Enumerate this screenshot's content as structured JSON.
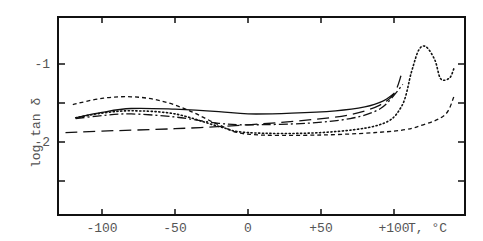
{
  "chart_data": {
    "type": "line",
    "title": "",
    "xlabel": "T, °C",
    "ylabel": "log tan δ",
    "xlim": [
      -125,
      155
    ],
    "ylim": [
      -3.0,
      -0.4
    ],
    "xticks": [
      -100,
      -50,
      0,
      50,
      100
    ],
    "xtick_labels": [
      "-100",
      "-50",
      "0",
      "+50",
      "+100"
    ],
    "yticks": [
      -1,
      -1.5,
      -2,
      -2.5
    ],
    "ytick_labels": [
      "-1",
      "",
      "-2",
      ""
    ],
    "grid": false,
    "legend": null,
    "series": [
      {
        "name": "solid",
        "style": "solid",
        "points": [
          [
            -118,
            -1.69
          ],
          [
            -100,
            -1.62
          ],
          [
            -80,
            -1.57
          ],
          [
            -50,
            -1.58
          ],
          [
            -20,
            -1.61
          ],
          [
            0,
            -1.64
          ],
          [
            30,
            -1.63
          ],
          [
            60,
            -1.6
          ],
          [
            80,
            -1.55
          ],
          [
            92,
            -1.48
          ],
          [
            100,
            -1.38
          ]
        ]
      },
      {
        "name": "long-dash",
        "style": "long-dash",
        "points": [
          [
            -125,
            -1.88
          ],
          [
            -100,
            -1.86
          ],
          [
            -50,
            -1.83
          ],
          [
            0,
            -1.78
          ],
          [
            40,
            -1.72
          ],
          [
            70,
            -1.65
          ],
          [
            90,
            -1.53
          ],
          [
            100,
            -1.38
          ],
          [
            105,
            -1.14
          ]
        ]
      },
      {
        "name": "dash-dot",
        "style": "dash-dot",
        "points": [
          [
            -118,
            -1.7
          ],
          [
            -100,
            -1.66
          ],
          [
            -80,
            -1.64
          ],
          [
            -50,
            -1.68
          ],
          [
            -20,
            -1.76
          ],
          [
            0,
            -1.78
          ],
          [
            40,
            -1.76
          ],
          [
            70,
            -1.7
          ],
          [
            90,
            -1.58
          ],
          [
            100,
            -1.4
          ],
          [
            106,
            -1.26
          ]
        ]
      },
      {
        "name": "dotted",
        "style": "dotted",
        "points": [
          [
            -118,
            -1.69
          ],
          [
            -100,
            -1.63
          ],
          [
            -80,
            -1.6
          ],
          [
            -50,
            -1.64
          ],
          [
            -20,
            -1.8
          ],
          [
            0,
            -1.88
          ],
          [
            50,
            -1.88
          ],
          [
            90,
            -1.78
          ],
          [
            105,
            -1.55
          ],
          [
            112,
            -1.1
          ],
          [
            117,
            -0.82
          ],
          [
            122,
            -0.78
          ],
          [
            128,
            -0.95
          ],
          [
            132,
            -1.19
          ],
          [
            138,
            -1.18
          ],
          [
            141,
            -1.06
          ]
        ]
      },
      {
        "name": "short-dash",
        "style": "short-dash",
        "points": [
          [
            -120,
            -1.52
          ],
          [
            -100,
            -1.44
          ],
          [
            -80,
            -1.42
          ],
          [
            -60,
            -1.47
          ],
          [
            -40,
            -1.6
          ],
          [
            -20,
            -1.78
          ],
          [
            0,
            -1.9
          ],
          [
            50,
            -1.91
          ],
          [
            100,
            -1.86
          ],
          [
            120,
            -1.78
          ],
          [
            135,
            -1.65
          ],
          [
            141,
            -1.42
          ]
        ]
      }
    ]
  }
}
